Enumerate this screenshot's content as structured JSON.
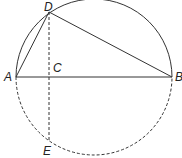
{
  "diagram": {
    "title": "",
    "type": "circle-geometry",
    "points": {
      "A": {
        "label": "A",
        "x": 16,
        "y": 77
      },
      "B": {
        "label": "B",
        "x": 172,
        "y": 77
      },
      "C": {
        "label": "C",
        "x": 49,
        "y": 77
      },
      "D": {
        "label": "D",
        "x": 49,
        "y": 12
      },
      "E": {
        "label": "E",
        "x": 49,
        "y": 142
      }
    },
    "segments": [
      {
        "from": "A",
        "to": "B",
        "style": "solid"
      },
      {
        "from": "A",
        "to": "D",
        "style": "solid"
      },
      {
        "from": "D",
        "to": "B",
        "style": "solid"
      },
      {
        "from": "D",
        "to": "E",
        "style": "dashed"
      }
    ],
    "circle": {
      "upper_arc": "solid",
      "lower_arc": "dashed"
    },
    "colors": {
      "stroke": "#333333",
      "label": "#222222"
    }
  }
}
